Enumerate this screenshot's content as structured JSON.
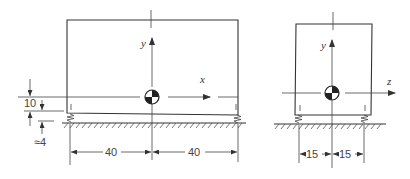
{
  "diagram": {
    "side_view": {
      "axes": {
        "vertical": "y",
        "horizontal": "x"
      },
      "dimensions": {
        "left_half": "40",
        "right_half": "40",
        "cg_height": "10",
        "spring_height": "≈4"
      }
    },
    "end_view": {
      "axes": {
        "vertical": "y",
        "horizontal": "z"
      },
      "dimensions": {
        "left_half": "15",
        "right_half": "15"
      }
    },
    "colors": {
      "line": "#333333",
      "background": "#ffffff"
    }
  }
}
